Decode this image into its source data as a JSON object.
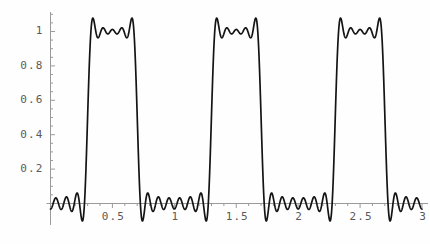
{
  "chart_data": {
    "type": "line",
    "title": "",
    "subtitle": "",
    "xlabel": "",
    "ylabel": "",
    "xlim": [
      -0.02,
      3.05
    ],
    "ylim": [
      -0.13,
      1.16
    ],
    "grid": false,
    "legend": null,
    "legend_position": "none",
    "line_color": "#141414",
    "axis_color": "#9a9a9a",
    "tick_label_color": "#5a5a5a",
    "x_ticks_major": [
      0.5,
      1,
      1.5,
      2,
      2.5,
      3
    ],
    "x_tick_labels": [
      "0.5",
      "1",
      "1.5",
      "2",
      "2.5",
      "3"
    ],
    "y_ticks_major": [
      0.2,
      0.4,
      0.6,
      0.8,
      1
    ],
    "y_tick_labels": [
      "0.2",
      "0.4",
      "0.6",
      "0.8",
      "1"
    ],
    "x_minor_step": 0.1,
    "y_minor_step": 0.05,
    "series": [
      {
        "name": "partial-sum",
        "period": 1.0,
        "pulse_centers": [
          0.5,
          1.5,
          2.5
        ],
        "peak_value": 1.09,
        "inter_peak_dip": 0.915,
        "ripple_min": -0.09,
        "ripple_max": 0.06,
        "harmonics": 11,
        "duty": 0.4,
        "x": [
          0,
          0.01,
          0.02,
          0.03,
          0.04,
          0.05,
          0.06,
          0.07,
          0.08,
          0.09,
          0.1,
          0.11,
          0.12,
          0.13,
          0.14,
          0.15,
          0.16,
          0.17,
          0.18,
          0.19,
          0.2,
          0.21,
          0.22,
          0.23,
          0.24,
          0.25,
          0.26,
          0.27,
          0.28,
          0.29,
          0.3,
          0.31,
          0.32,
          0.33,
          0.34,
          0.35,
          0.36,
          0.37,
          0.38,
          0.39,
          0.4,
          0.41,
          0.42,
          0.43,
          0.44,
          0.45,
          0.46,
          0.47,
          0.48,
          0.49,
          0.5,
          0.51,
          0.52,
          0.53,
          0.54,
          0.55,
          0.56,
          0.57,
          0.58,
          0.59,
          0.6,
          0.61,
          0.62,
          0.63,
          0.64,
          0.65,
          0.66,
          0.67,
          0.68,
          0.69,
          0.7,
          0.71,
          0.72,
          0.73,
          0.74,
          0.75,
          0.76,
          0.77,
          0.78,
          0.79,
          0.8,
          0.81,
          0.82,
          0.83,
          0.84,
          0.85,
          0.86,
          0.87,
          0.88,
          0.89,
          0.9,
          0.91,
          0.92,
          0.93,
          0.94,
          0.95,
          0.96,
          0.97,
          0.98,
          0.99,
          1
        ],
        "y_one_period": [
          0.02,
          0.03,
          0.04,
          0.03,
          0.01,
          -0.02,
          -0.05,
          -0.07,
          -0.08,
          -0.07,
          -0.04,
          0.0,
          0.03,
          0.05,
          0.06,
          0.05,
          0.02,
          -0.02,
          -0.06,
          -0.08,
          -0.09,
          -0.07,
          -0.02,
          0.06,
          0.18,
          0.33,
          0.5,
          0.67,
          0.82,
          0.95,
          1.03,
          1.08,
          1.09,
          1.07,
          1.03,
          0.98,
          0.94,
          0.92,
          0.92,
          0.95,
          0.99,
          1.03,
          1.07,
          1.09,
          1.09,
          1.06,
          1.01,
          0.93,
          0.82,
          0.69,
          0.55,
          0.4,
          0.26,
          0.14,
          0.05,
          -0.01,
          -0.05,
          -0.07,
          -0.07,
          -0.05,
          -0.02,
          0.01,
          0.04,
          0.06,
          0.06,
          0.04,
          0.01,
          -0.03,
          -0.06,
          -0.08,
          -0.09,
          -0.08,
          -0.05,
          -0.01,
          0.02,
          0.04,
          0.05,
          0.04,
          0.02,
          -0.01,
          -0.04,
          -0.06,
          -0.07,
          -0.06,
          -0.03,
          0.0,
          0.03,
          0.05,
          0.05,
          0.04,
          0.02,
          -0.01,
          -0.04,
          -0.06,
          -0.07,
          -0.06,
          -0.04,
          -0.01,
          0.02,
          0.02
        ]
      }
    ]
  },
  "axes": {
    "y_axis_name": "y-axis",
    "x_axis_name": "x-axis"
  }
}
